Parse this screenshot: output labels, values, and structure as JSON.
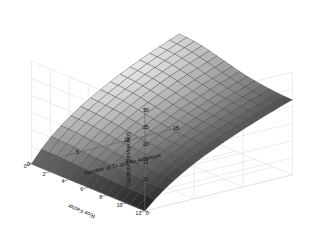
{
  "chart_data": {
    "type": "surface",
    "title": "",
    "xlabel": "Number of Tx and Rx Antennas",
    "ylabel": "Rice Factor",
    "zlabel": "Capacity [Bits/sec/Hz]",
    "xlim": [
      0,
      15
    ],
    "ylim": [
      0,
      12
    ],
    "zlim": [
      0,
      30
    ],
    "xticks": [
      0,
      5,
      10,
      15
    ],
    "yticks": [
      0,
      2,
      4,
      6,
      8,
      10,
      12
    ],
    "zticks": [
      0,
      5,
      10,
      15,
      20,
      25,
      30
    ],
    "xtick_labels": [
      "0",
      "5",
      "10",
      "15"
    ],
    "ytick_labels": [
      "0",
      "2",
      "4",
      "6",
      "8",
      "10",
      "12"
    ],
    "ztick_labels": [
      "0",
      "5",
      "10",
      "15",
      "20",
      "25",
      "30"
    ],
    "grid": true,
    "legend": "none",
    "colormap": "gray",
    "shading": "faceted",
    "mesh_edge_color": "#303030",
    "view_azimuth": -37.5,
    "view_elevation": 30,
    "x_values": [
      0,
      1,
      2,
      3,
      4,
      5,
      6,
      7,
      8,
      9,
      10,
      11,
      12,
      13,
      14,
      15
    ],
    "y_values": [
      0,
      0.8,
      1.6,
      2.4,
      3.2,
      4,
      4.8,
      5.6,
      6.4,
      7.2,
      8,
      8.8,
      9.6,
      10.4,
      11.2,
      12
    ],
    "z_description": "Capacity rises steeply with number of antennas and decreases mildly with Rice factor; surface saturates near 27-28 Bits/sec/Hz at 15 antennas and low Rice factor, and is ~0 at 0 antennas.",
    "z_matrix": [
      [
        0.0,
        3.6,
        6.6,
        9.1,
        11.3,
        13.3,
        15.1,
        16.8,
        18.4,
        19.9,
        21.3,
        22.6,
        23.9,
        25.1,
        26.3,
        27.4
      ],
      [
        0.0,
        3.5,
        6.5,
        9.0,
        11.2,
        13.2,
        15.0,
        16.7,
        18.3,
        19.8,
        21.2,
        22.5,
        23.8,
        25.0,
        26.2,
        27.3
      ],
      [
        0.0,
        3.5,
        6.4,
        8.9,
        11.1,
        13.0,
        14.8,
        16.5,
        18.1,
        19.6,
        21.0,
        22.3,
        23.6,
        24.8,
        26.0,
        27.1
      ],
      [
        0.0,
        3.4,
        6.3,
        8.7,
        10.9,
        12.8,
        14.6,
        16.3,
        17.9,
        19.3,
        20.7,
        22.0,
        23.3,
        24.5,
        25.6,
        26.7
      ],
      [
        0.0,
        3.3,
        6.1,
        8.5,
        10.6,
        12.5,
        14.3,
        15.9,
        17.5,
        18.9,
        20.3,
        21.6,
        22.8,
        24.0,
        25.1,
        26.2
      ],
      [
        0.0,
        3.2,
        5.9,
        8.3,
        10.3,
        12.2,
        13.9,
        15.5,
        17.0,
        18.4,
        19.8,
        21.1,
        22.3,
        23.4,
        24.5,
        25.6
      ],
      [
        0.0,
        3.1,
        5.7,
        8.0,
        10.0,
        11.8,
        13.5,
        15.1,
        16.6,
        18.0,
        19.3,
        20.5,
        21.7,
        22.8,
        23.9,
        25.0
      ],
      [
        0.0,
        3.0,
        5.6,
        7.8,
        9.7,
        11.5,
        13.1,
        14.7,
        16.1,
        17.5,
        18.8,
        20.0,
        21.2,
        22.3,
        23.3,
        24.4
      ],
      [
        0.0,
        2.9,
        5.4,
        7.6,
        9.5,
        11.2,
        12.8,
        14.3,
        15.7,
        17.1,
        18.3,
        19.5,
        20.7,
        21.8,
        22.8,
        23.8
      ],
      [
        0.0,
        2.9,
        5.3,
        7.4,
        9.3,
        11.0,
        12.5,
        14.0,
        15.4,
        16.7,
        17.9,
        19.1,
        20.2,
        21.3,
        22.3,
        23.3
      ],
      [
        0.0,
        2.8,
        5.2,
        7.3,
        9.1,
        10.8,
        12.3,
        13.7,
        15.1,
        16.4,
        17.6,
        18.8,
        19.9,
        20.9,
        21.9,
        22.9
      ],
      [
        0.0,
        2.8,
        5.1,
        7.2,
        9.0,
        10.6,
        12.1,
        13.5,
        14.9,
        16.1,
        17.3,
        18.5,
        19.6,
        20.6,
        21.6,
        22.6
      ],
      [
        0.0,
        2.7,
        5.0,
        7.1,
        8.9,
        10.5,
        12.0,
        13.4,
        14.7,
        15.9,
        17.1,
        18.3,
        19.4,
        20.4,
        21.4,
        22.3
      ],
      [
        0.0,
        2.7,
        5.0,
        7.0,
        8.8,
        10.4,
        11.9,
        13.3,
        14.6,
        15.8,
        17.0,
        18.1,
        19.2,
        20.2,
        21.2,
        22.1
      ],
      [
        0.0,
        2.7,
        4.9,
        7.0,
        8.7,
        10.3,
        11.8,
        13.2,
        14.5,
        15.7,
        16.9,
        18.0,
        19.1,
        20.1,
        21.1,
        22.0
      ],
      [
        0.0,
        2.6,
        4.9,
        6.9,
        8.7,
        10.3,
        11.8,
        13.1,
        14.4,
        15.6,
        16.8,
        17.9,
        19.0,
        20.0,
        21.0,
        21.9
      ]
    ]
  },
  "axes": {
    "z_label": "Capacity [Bits/sec/Hz]",
    "y_label": "Rice Factor",
    "x_label": "Number of Tx and Rx Antennas",
    "z_ticks": [
      "30",
      "25",
      "20",
      "15",
      "10",
      "5",
      "0"
    ],
    "y_ticks": [
      "12",
      "10",
      "8",
      "6",
      "4",
      "2",
      "0"
    ],
    "x_ticks": [
      "0",
      "5",
      "10",
      "15"
    ]
  },
  "style": {
    "background": "#ffffff",
    "grid_color": "#d8d8d8",
    "axis_color": "#666666",
    "text_color": "#111111"
  }
}
